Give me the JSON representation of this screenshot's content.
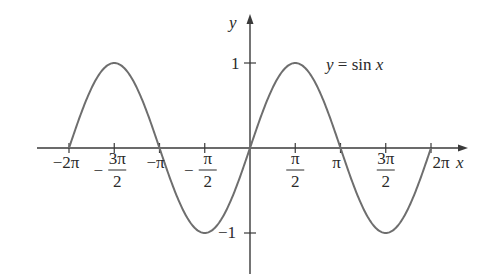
{
  "chart_data": {
    "type": "line",
    "title": "",
    "function": "y = sin x",
    "annotation": "y = sin x",
    "xlabel": "x",
    "ylabel": "y",
    "xlim": [
      -6.6,
      6.9
    ],
    "ylim": [
      -1.5,
      1.6
    ],
    "grid": false,
    "legend": "none",
    "x_ticks": [
      {
        "value": -6.2832,
        "label": "−2π"
      },
      {
        "value": -4.7124,
        "label": "−3π/2"
      },
      {
        "value": -3.1416,
        "label": "−π"
      },
      {
        "value": -1.5708,
        "label": "−π/2"
      },
      {
        "value": 1.5708,
        "label": "π/2"
      },
      {
        "value": 3.1416,
        "label": "π"
      },
      {
        "value": 4.7124,
        "label": "3π/2"
      },
      {
        "value": 6.2832,
        "label": "2π"
      }
    ],
    "y_ticks": [
      {
        "value": 1,
        "label": "1"
      },
      {
        "value": -1,
        "label": "−1"
      }
    ],
    "series": [
      {
        "name": "sin x",
        "x": [
          -6.2832,
          -4.7124,
          -3.1416,
          -1.5708,
          0,
          1.5708,
          3.1416,
          4.7124,
          6.2832
        ],
        "values": [
          0,
          1,
          0,
          -1,
          0,
          1,
          0,
          -1,
          0
        ]
      }
    ],
    "domain": [
      -6.2832,
      6.2832
    ]
  },
  "labels": {
    "x_axis": "x",
    "y_axis": "y",
    "curve": "y = sin x",
    "y_one": "1",
    "y_neg_one": "−1"
  }
}
